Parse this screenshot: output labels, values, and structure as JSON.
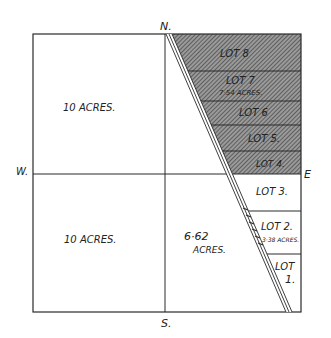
{
  "compass": {
    "north": "N.",
    "south": "S.",
    "east": "E",
    "west": "W."
  },
  "parcels": {
    "nw": {
      "label": "10 ACRES."
    },
    "sw": {
      "label": "10 ACRES."
    },
    "se_west": {
      "line1": "6·62",
      "line2": "ACRES."
    }
  },
  "lots": [
    {
      "name": "LOT 8",
      "line1": "LOT 8",
      "line2": ""
    },
    {
      "name": "LOT 7",
      "line1": "LOT 7",
      "line2": "7·54 ACRES."
    },
    {
      "name": "LOT 6",
      "line1": "LOT 6",
      "line2": ""
    },
    {
      "name": "LOT 5",
      "line1": "LOT 5.",
      "line2": ""
    },
    {
      "name": "LOT 4",
      "line1": "LOT 4.",
      "line2": ""
    },
    {
      "name": "LOT 3",
      "line1": "LOT 3.",
      "line2": ""
    },
    {
      "name": "LOT 2",
      "line1": "LOT 2.",
      "line2": "3·38 ACRES."
    },
    {
      "name": "LOT 1",
      "line1": "LOT",
      "line2": "1."
    }
  ],
  "colors": {
    "ink": "#2a2a2a",
    "hatch": "#555555",
    "paper": "#ffffff"
  }
}
